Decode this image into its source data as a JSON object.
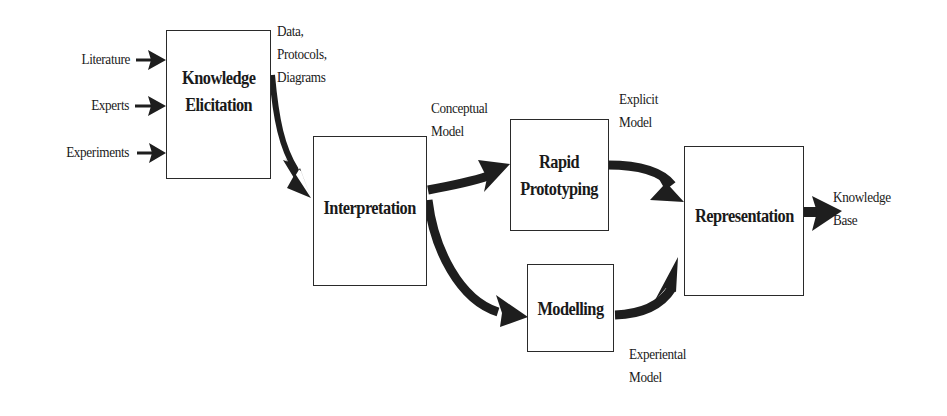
{
  "diagram": {
    "inputs": [
      {
        "label": "Literature"
      },
      {
        "label": "Experts"
      },
      {
        "label": "Experiments"
      }
    ],
    "boxes": {
      "knowledge_elicitation": {
        "label": "Knowledge\nElicitation"
      },
      "interpretation": {
        "label": "Interpretation"
      },
      "rapid_prototyping": {
        "label": "Rapid\nPrototyping"
      },
      "modelling": {
        "label": "Modelling"
      },
      "representation": {
        "label": "Representation"
      }
    },
    "edge_labels": {
      "elicitation_output": "Data,\nProtocols,\nDiagrams",
      "conceptual_model": "Conceptual\nModel",
      "explicit_model": "Explicit\nModel",
      "experiential_model": "Experiental\nModel",
      "knowledge_base": "Knowledge\nBase"
    },
    "colors": {
      "arrow": "#1e1e1e",
      "box_border": "#2a2a2a",
      "background": "#ffffff"
    }
  }
}
